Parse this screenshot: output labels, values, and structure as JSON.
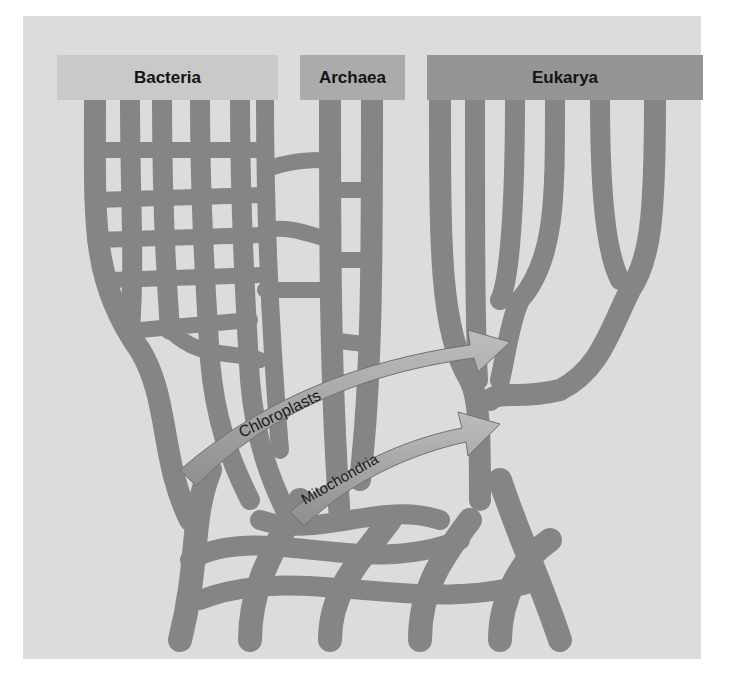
{
  "diagram": {
    "type": "phylogenetic-network",
    "domains": [
      {
        "id": "bacteria",
        "label": "Bacteria"
      },
      {
        "id": "archaea",
        "label": "Archaea"
      },
      {
        "id": "eukarya",
        "label": "Eukarya"
      }
    ],
    "arrows": [
      {
        "id": "chloroplasts",
        "label": "Chloroplasts",
        "from": "bacteria",
        "to": "eukarya"
      },
      {
        "id": "mitochondria",
        "label": "Mitochondria",
        "from": "bacteria",
        "to": "eukarya"
      }
    ],
    "colors": {
      "background": "#dcdcdc",
      "branch": "#8a8a8a",
      "branch_dark": "#6a6a6a",
      "arrow": "#a8a8a8",
      "bacteria_box": "#c9c9c9",
      "archaea_box": "#ababab",
      "eukarya_box": "#959595",
      "label_text": "#141414"
    }
  }
}
